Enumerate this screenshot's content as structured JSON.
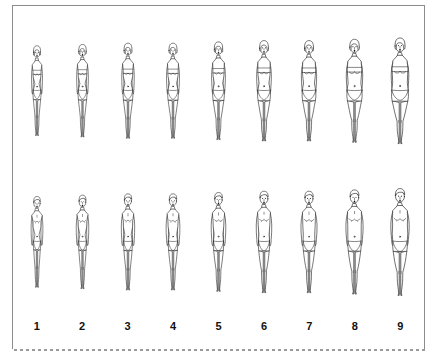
{
  "panel": {
    "title": "Figure Rating Scale",
    "background_color": "#ffffff",
    "border_color": "#8c8c8c",
    "dashed_border_color": "#9a9a9a",
    "line_color": "#111111"
  },
  "scale": {
    "numbers": [
      "1",
      "2",
      "3",
      "4",
      "5",
      "6",
      "7",
      "8",
      "9"
    ],
    "rows": [
      {
        "id": "female",
        "sex_label": "female",
        "figures": [
          {
            "number": "1",
            "body_size": "very thin",
            "clothing": "bandeau top and bikini bottom",
            "width_factor": 0.7
          },
          {
            "number": "2",
            "body_size": "thin",
            "clothing": "bandeau top and bikini bottom",
            "width_factor": 0.78
          },
          {
            "number": "3",
            "body_size": "slender",
            "clothing": "bandeau top and bikini bottom",
            "width_factor": 0.86
          },
          {
            "number": "4",
            "body_size": "average",
            "clothing": "bandeau top and bikini bottom",
            "width_factor": 0.94
          },
          {
            "number": "5",
            "body_size": "slightly heavy",
            "clothing": "bandeau top and bikini bottom",
            "width_factor": 1.02
          },
          {
            "number": "6",
            "body_size": "heavy",
            "clothing": "bandeau top and bikini bottom",
            "width_factor": 1.11
          },
          {
            "number": "7",
            "body_size": "overweight",
            "clothing": "bandeau top and bikini bottom",
            "width_factor": 1.21
          },
          {
            "number": "8",
            "body_size": "very overweight",
            "clothing": "bandeau top and bikini bottom",
            "width_factor": 1.32
          },
          {
            "number": "9",
            "body_size": "obese",
            "clothing": "bandeau top and bikini bottom",
            "width_factor": 1.44
          }
        ]
      },
      {
        "id": "male",
        "sex_label": "male",
        "figures": [
          {
            "number": "1",
            "body_size": "very thin",
            "clothing": "briefs",
            "width_factor": 0.7
          },
          {
            "number": "2",
            "body_size": "thin",
            "clothing": "briefs",
            "width_factor": 0.78
          },
          {
            "number": "3",
            "body_size": "slender",
            "clothing": "briefs",
            "width_factor": 0.86
          },
          {
            "number": "4",
            "body_size": "average",
            "clothing": "briefs",
            "width_factor": 0.94
          },
          {
            "number": "5",
            "body_size": "slightly heavy",
            "clothing": "briefs",
            "width_factor": 1.02
          },
          {
            "number": "6",
            "body_size": "heavy",
            "clothing": "briefs",
            "width_factor": 1.11
          },
          {
            "number": "7",
            "body_size": "overweight",
            "clothing": "briefs",
            "width_factor": 1.21
          },
          {
            "number": "8",
            "body_size": "very overweight",
            "clothing": "briefs",
            "width_factor": 1.32
          },
          {
            "number": "9",
            "body_size": "obese",
            "clothing": "briefs",
            "width_factor": 1.44
          }
        ]
      }
    ]
  }
}
